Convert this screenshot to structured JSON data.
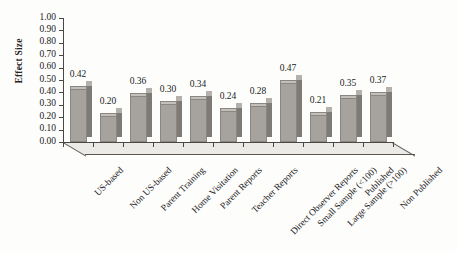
{
  "chart_data": {
    "type": "bar",
    "title": "",
    "subtitle": "",
    "xlabel": "",
    "ylabel": "Effect Size",
    "ylim": [
      0.0,
      1.0
    ],
    "ytick_labels": [
      "1.00",
      "0.90",
      "0.80",
      "0.70",
      "0.60",
      "0.50",
      "0.40",
      "0.30",
      "0.20",
      "0.10",
      "0.00"
    ],
    "ytick_values": [
      1.0,
      0.9,
      0.8,
      0.7,
      0.6,
      0.5,
      0.4,
      0.3,
      0.2,
      0.1,
      0.0
    ],
    "grid": false,
    "legend": false,
    "legend_position": "none",
    "style_3d": true,
    "categories": [
      "US-based",
      "Non US-based",
      "Parent Training",
      "Home Visitation",
      "Parent Reports",
      "Teacher Reports",
      "Direct Observer Reports",
      "Small Sample (<100)",
      "Large Sample (>100)",
      "Published",
      "Non Published"
    ],
    "values": [
      0.42,
      0.2,
      0.36,
      0.3,
      0.34,
      0.24,
      0.28,
      0.47,
      0.21,
      0.35,
      0.37
    ],
    "value_labels": [
      "0.42",
      "0.20",
      "0.36",
      "0.30",
      "0.34",
      "0.24",
      "0.28",
      "0.47",
      "0.21",
      "0.35",
      "0.37"
    ],
    "bar_color": "#a6a39e",
    "bar_side_color": "#7e7b76",
    "bar_top_color": "#c3c0bb",
    "axis_color": "#4a4845",
    "text_color": "#22201e",
    "background_color": "#fdfdfb"
  }
}
